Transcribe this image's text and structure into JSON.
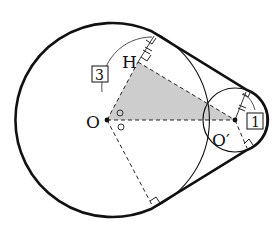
{
  "diagram": {
    "type": "geometry",
    "points": {
      "O": {
        "label": "O",
        "x": 107,
        "y": 120
      },
      "O_prime": {
        "label": "O′",
        "x": 235,
        "y": 120
      },
      "H": {
        "label": "H",
        "x": 138,
        "y": 62
      }
    },
    "radius_labels": {
      "big": "3",
      "small": "1"
    },
    "colors": {
      "stroke": "#111111",
      "shade": "#c8c8c8",
      "background": "#ffffff"
    },
    "markers": {
      "angle_marks": [
        "○",
        "○"
      ],
      "right_angles": 5,
      "equal_tick_marks": 2
    }
  }
}
